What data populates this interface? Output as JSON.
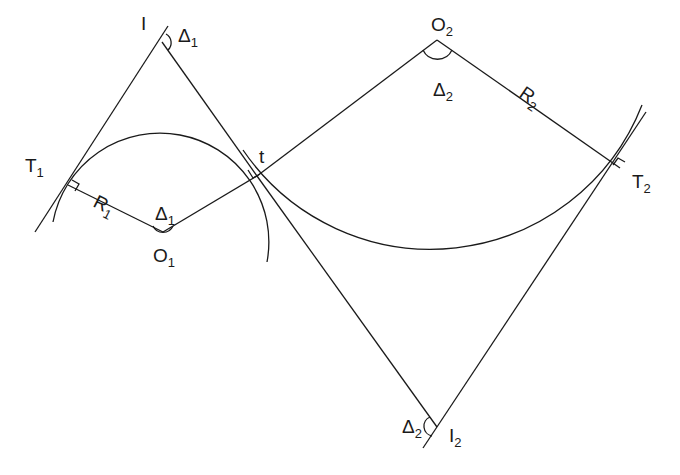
{
  "diagram": {
    "type": "reverse-curve-geometry",
    "stroke_color": "#1a1a1a",
    "background": "#ffffff",
    "labels": {
      "I": {
        "base": "I",
        "sub": ""
      },
      "delta1_top": {
        "base": "Δ",
        "sub": "1"
      },
      "T1": {
        "base": "T",
        "sub": "1"
      },
      "R1": {
        "base": "R",
        "sub": "1"
      },
      "delta1_center": {
        "base": "Δ",
        "sub": "1"
      },
      "O1": {
        "base": "O",
        "sub": "1"
      },
      "t": {
        "base": "t",
        "sub": ""
      },
      "O2": {
        "base": "O",
        "sub": "2"
      },
      "delta2_center": {
        "base": "Δ",
        "sub": "2"
      },
      "R2": {
        "base": "R",
        "sub": "2"
      },
      "T2": {
        "base": "T",
        "sub": "2"
      },
      "delta2_bottom": {
        "base": "Δ",
        "sub": "2"
      },
      "I2": {
        "base": "I",
        "sub": "2"
      }
    },
    "points": {
      "I": [
        162,
        42
      ],
      "T1": [
        68,
        185
      ],
      "O1": [
        163,
        232
      ],
      "t": [
        257,
        176
      ],
      "O2": [
        437,
        40
      ],
      "T2": [
        620,
        168
      ],
      "I2": [
        437,
        427
      ]
    },
    "circles": [
      {
        "name": "curve-1",
        "center": "O1",
        "radius": 105
      },
      {
        "name": "curve-2",
        "center": "O2",
        "radius": 227
      }
    ]
  }
}
